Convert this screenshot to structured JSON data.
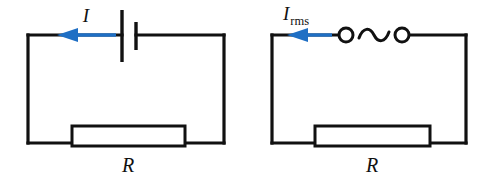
{
  "figure": {
    "width": 497,
    "height": 186,
    "background_color": "#ffffff",
    "wire_color": "#111111",
    "arrow_color": "#1f6fc4"
  },
  "circuits": [
    {
      "id": "dc-circuit",
      "kind": "dc",
      "source_type": "battery",
      "current_label": "I",
      "current_label_subscript": "",
      "resistor_label": "R",
      "arrow_direction": "left",
      "loop": {
        "x": 28,
        "y": 35,
        "width": 196,
        "height": 108
      },
      "resistor_box": {
        "x": 72,
        "y": 126,
        "width": 113,
        "height": 20
      },
      "battery": {
        "long_plate_x": 122,
        "long_plate_top": 10,
        "long_plate_bottom": 62,
        "short_plate_x": 136,
        "short_plate_top": 22,
        "short_plate_bottom": 50
      },
      "arrow": {
        "tail_x": 116,
        "tip_x": 57,
        "y": 35
      },
      "current_label_pos": {
        "x": 86,
        "y": 22
      },
      "resistor_label_pos": {
        "x": 128,
        "y": 172
      }
    },
    {
      "id": "ac-circuit",
      "kind": "ac",
      "source_type": "ac-generator",
      "current_label": "I",
      "current_label_subscript": "rms",
      "resistor_label": "R",
      "arrow_direction": "left",
      "loop": {
        "x": 272,
        "y": 35,
        "width": 194,
        "height": 108
      },
      "resistor_box": {
        "x": 315,
        "y": 126,
        "width": 115,
        "height": 20
      },
      "ac_source": {
        "left_terminal_x": 346,
        "right_terminal_x": 402,
        "terminal_y": 35,
        "terminal_radius": 7,
        "wave_start_x": 359,
        "wave_end_x": 389
      },
      "arrow": {
        "tail_x": 332,
        "tip_x": 287,
        "y": 35
      },
      "current_label_pos": {
        "x": 302,
        "y": 20
      },
      "resistor_label_pos": {
        "x": 372,
        "y": 172
      }
    }
  ]
}
